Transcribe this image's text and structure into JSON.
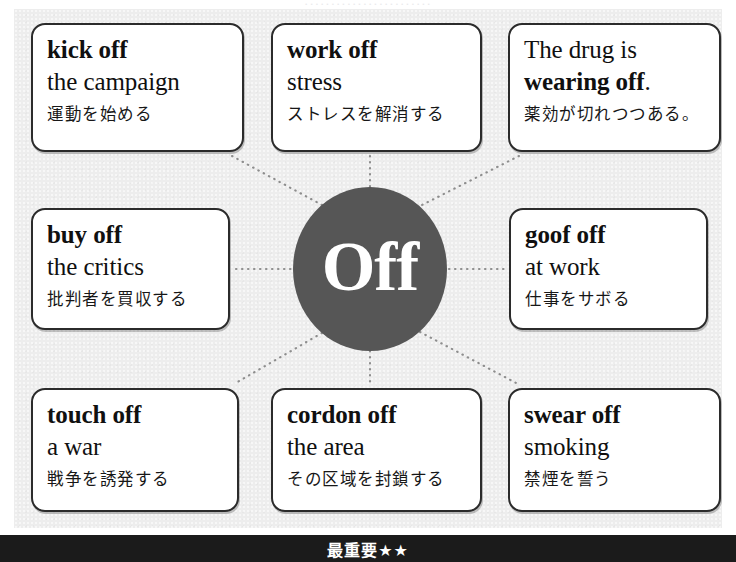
{
  "diagram": {
    "type": "mind-map",
    "hub_label": "Off",
    "hub_color": "#565656",
    "panel_color": "#ededed",
    "card_border_color": "#2b2b2b",
    "connector_style": "dotted",
    "top_cutoff_text": "························"
  },
  "cards": [
    {
      "id": "kick-off",
      "headword": "kick off",
      "headword_bold": true,
      "complement": "the campaign",
      "complement_bold": false,
      "japanese": "運動を始める",
      "position": "top-left"
    },
    {
      "id": "work-off",
      "headword": "work off",
      "headword_bold": true,
      "complement": "stress",
      "complement_bold": false,
      "japanese": "ストレスを解消する",
      "position": "top-center"
    },
    {
      "id": "wearing-off",
      "headword": "The drug is",
      "headword_bold": false,
      "complement": "wearing off",
      "complement_bold": true,
      "complement_suffix": ".",
      "japanese": "薬効が切れつつある。",
      "position": "top-right"
    },
    {
      "id": "buy-off",
      "headword": "buy off",
      "headword_bold": true,
      "complement": "the critics",
      "complement_bold": false,
      "japanese": "批判者を買収する",
      "position": "middle-left"
    },
    {
      "id": "goof-off",
      "headword": "goof off",
      "headword_bold": true,
      "complement": "at work",
      "complement_bold": false,
      "japanese": "仕事をサボる",
      "position": "middle-right"
    },
    {
      "id": "touch-off",
      "headword": "touch off",
      "headword_bold": true,
      "complement": "a war",
      "complement_bold": false,
      "japanese": "戦争を誘発する",
      "position": "bottom-left"
    },
    {
      "id": "cordon-off",
      "headword": "cordon off",
      "headword_bold": true,
      "complement": "the area",
      "complement_bold": false,
      "japanese": "その区域を封鎖する",
      "position": "bottom-center"
    },
    {
      "id": "swear-off",
      "headword": "swear off",
      "headword_bold": true,
      "complement": "smoking",
      "complement_bold": false,
      "japanese": "禁煙を誓う",
      "position": "bottom-right"
    }
  ],
  "footer": {
    "label": "最重要★★",
    "background": "#1b1b1b",
    "text_color": "#ffffff"
  }
}
